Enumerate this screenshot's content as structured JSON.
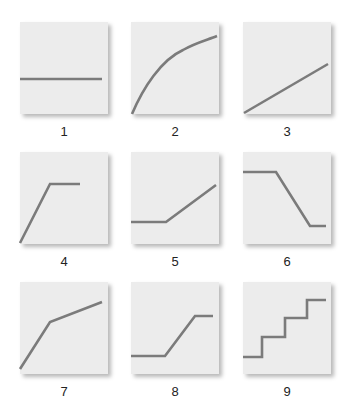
{
  "diagram": {
    "line_color": "#7b7b7b",
    "box_color": "#ececec",
    "panels": [
      {
        "label": "1",
        "shape": "constant (flat horizontal line)",
        "path": "M0 57 L82 57"
      },
      {
        "label": "2",
        "shape": "concave increasing curve (diminishing returns)",
        "path": "M1 92 C12 66 30 38 52 28 C64 21 76 18 86 14"
      },
      {
        "label": "3",
        "shape": "linear increase",
        "path": "M1 91 L85 42"
      },
      {
        "label": "4",
        "shape": "steep rise then plateau",
        "path": "M0 91 L30 32 L60 32"
      },
      {
        "label": "5",
        "shape": "flat then linear rise",
        "path": "M0 70 L35 70 L85 33"
      },
      {
        "label": "6",
        "shape": "flat, steep drop, flat",
        "path": "M0 20 L33 20 L67 74 L83 74"
      },
      {
        "label": "7",
        "shape": "steep rise then slower rise",
        "path": "M0 87 L30 40 L82 20"
      },
      {
        "label": "8",
        "shape": "flat, rise, flat (S-step)",
        "path": "M0 74 L34 74 L64 34 L82 34"
      },
      {
        "label": "9",
        "shape": "staircase step function",
        "path": "M0 75 L19 75 L19 55 L42 55 L42 36 L64 36 L64 18 L83 18"
      }
    ]
  }
}
